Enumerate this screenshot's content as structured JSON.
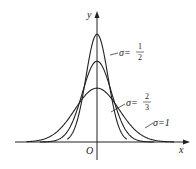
{
  "chart_data": {
    "type": "line",
    "title": "",
    "xlabel": "x",
    "ylabel": "y",
    "origin_label": "O",
    "grid": false,
    "legend": "inline annotations",
    "series": [
      {
        "name": "σ = 1/2",
        "sigma": 0.5,
        "mu": 0,
        "label_sym": "σ",
        "label_num": "1",
        "label_den": "2"
      },
      {
        "name": "σ = 2/3",
        "sigma": 0.6667,
        "mu": 0,
        "label_sym": "σ",
        "label_num": "2",
        "label_den": "3"
      },
      {
        "name": "σ = 1",
        "sigma": 1,
        "mu": 0,
        "label_text": "σ=1"
      }
    ],
    "x_range": [
      -3.2,
      3.2
    ]
  },
  "labels": {
    "x_axis": "x",
    "y_axis": "y",
    "origin": "O",
    "s1_sym": "σ=",
    "s1_num": "1",
    "s1_den": "2",
    "s2_sym": "σ=",
    "s2_num": "2",
    "s2_den": "3",
    "s3": "σ=1"
  }
}
